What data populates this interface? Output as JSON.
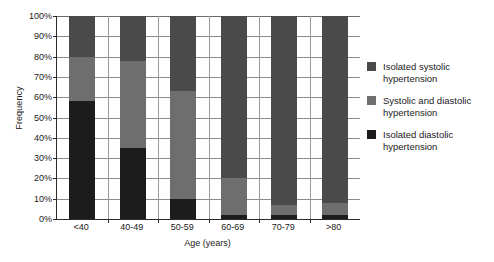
{
  "chart_data": {
    "type": "bar",
    "subtype": "stacked-bar-100-percent",
    "title": "",
    "xlabel": "Age (years)",
    "ylabel": "Frequency",
    "categories": [
      "<40",
      "40-49",
      "50-59",
      "60-69",
      "70-79",
      ">80"
    ],
    "ylim": [
      0,
      100
    ],
    "ytick_labels": [
      "0%",
      "10%",
      "20%",
      "30%",
      "40%",
      "50%",
      "60%",
      "70%",
      "80%",
      "90%",
      "100%"
    ],
    "ytick_values": [
      0,
      10,
      20,
      30,
      40,
      50,
      60,
      70,
      80,
      90,
      100
    ],
    "grid": true,
    "legend_position": "right",
    "series": [
      {
        "name": "Isolated systolic hypertension",
        "color": "#4a4a4a",
        "values": [
          20,
          22,
          37,
          80,
          93,
          92
        ]
      },
      {
        "name": "Systolic and diastolic hypertension",
        "color": "#6e6e6e",
        "values": [
          22,
          43,
          53,
          18,
          5,
          6
        ]
      },
      {
        "name": "Isolated diastolic hypertension",
        "color": "#1c1c1c",
        "values": [
          58,
          35,
          10,
          2,
          2,
          2
        ]
      }
    ]
  },
  "axes": {
    "y_title": "Frequency",
    "x_title": "Age (years)"
  },
  "legend": {
    "items": [
      {
        "label": "Isolated systolic hypertension",
        "color": "#4a4a4a"
      },
      {
        "label": "Systolic and diastolic hypertension",
        "color": "#6e6e6e"
      },
      {
        "label": "Isolated diastolic hypertension",
        "color": "#1c1c1c"
      }
    ]
  }
}
